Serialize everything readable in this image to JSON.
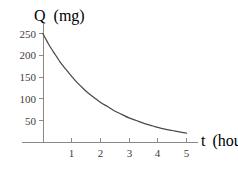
{
  "chart_data": {
    "type": "line",
    "title": "",
    "xlabel_variable": "t",
    "xlabel_unit": "(hours)",
    "ylabel_variable": "Q",
    "ylabel_unit": "(mg)",
    "xlim": [
      0,
      5.35
    ],
    "ylim": [
      0,
      262
    ],
    "xticks": [
      1,
      2,
      3,
      4,
      5
    ],
    "xtick_labels": [
      "1",
      "2",
      "3",
      "4",
      "5"
    ],
    "yticks": [
      50,
      100,
      150,
      200,
      250
    ],
    "ytick_labels": [
      "50",
      "100",
      "150",
      "200",
      "250"
    ],
    "grid": false,
    "legend": null,
    "series": [
      {
        "name": "Q",
        "x": [
          0.0,
          0.1,
          0.2,
          0.3,
          0.4,
          0.5,
          0.6,
          0.7,
          0.8,
          0.9,
          1.0,
          1.2,
          1.4,
          1.6,
          1.8,
          2.0,
          2.25,
          2.5,
          2.75,
          3.0,
          3.25,
          3.5,
          3.75,
          4.0,
          4.25,
          4.5,
          4.75,
          5.0
        ],
        "y": [
          250,
          238,
          226,
          215,
          205,
          195,
          185,
          176,
          168,
          160,
          152,
          137,
          124,
          112,
          102,
          92,
          82,
          72,
          64,
          56,
          50,
          44,
          39,
          34,
          30,
          27,
          24,
          21
        ]
      }
    ],
    "curve_color": "#4a4a4a",
    "axis_color": "#8a8a8a",
    "background_color": "#ffffff"
  }
}
